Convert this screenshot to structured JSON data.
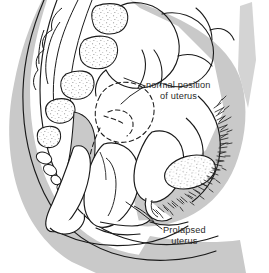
{
  "figure": {
    "view": "sagittal cross-section",
    "background_color": "#ffffff",
    "tissue_fill_color": "#c9c9c9",
    "organ_fill_color": "#ffffff",
    "outline_color": "#1a1a1a",
    "stipple_color": "#6e6e6e",
    "hatch_color": "#2a2a2a"
  },
  "labels": [
    {
      "id": "normal-position",
      "line1": "normal position",
      "line2": "of uterus",
      "leader": "dashed outline above and behind the prolapsed uterus"
    },
    {
      "id": "prolapsed",
      "line1": "Prolapsed",
      "line2": "uterus",
      "leader": "solid white uterine body descended into the vaginal canal"
    }
  ],
  "structures": [
    {
      "name": "lumbar-vertebrae",
      "fill": "#ffffff",
      "detail": "stippled"
    },
    {
      "name": "sacrum",
      "fill": "#c9c9c9",
      "detail": "plain"
    },
    {
      "name": "coccyx-segments",
      "fill": "#ffffff",
      "detail": "small ovals"
    },
    {
      "name": "spinal-canal",
      "fill": "#ffffff",
      "detail": "plain"
    },
    {
      "name": "intestinal-loops",
      "fill": "#c9c9c9",
      "detail": "outlined coils"
    },
    {
      "name": "normal-uterus-outline",
      "fill": "none",
      "detail": "dashed"
    },
    {
      "name": "prolapsed-uterus",
      "fill": "#ffffff",
      "detail": "plain"
    },
    {
      "name": "bladder",
      "fill": "#ffffff",
      "detail": "plain"
    },
    {
      "name": "vaginal-canal",
      "fill": "#ffffff",
      "detail": "plain"
    },
    {
      "name": "rectum",
      "fill": "#ffffff",
      "detail": "plain"
    },
    {
      "name": "pubic-bone",
      "fill": "#ffffff",
      "detail": "stippled oval"
    },
    {
      "name": "pubic-hair",
      "fill": "none",
      "detail": "dense hatching"
    },
    {
      "name": "abdominal-wall",
      "fill": "#c9c9c9",
      "detail": "plain"
    },
    {
      "name": "back-soft-tissue",
      "fill": "#c9c9c9",
      "detail": "plain"
    },
    {
      "name": "thigh",
      "fill": "#c9c9c9",
      "detail": "plain"
    }
  ]
}
